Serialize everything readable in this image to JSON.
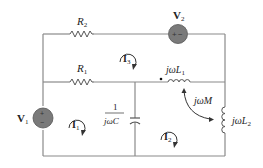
{
  "diagram": {
    "type": "circuit",
    "components": {
      "R2": {
        "label": "R",
        "sub": "2"
      },
      "R1": {
        "label": "R",
        "sub": "1"
      },
      "V2": {
        "label": "V",
        "sub": "2"
      },
      "V1": {
        "label": "V",
        "sub": "1",
        "plus": "+",
        "minus": "−"
      },
      "L1": {
        "label": "jωL",
        "sub": "1"
      },
      "L2": {
        "label": "jωL",
        "sub": "2"
      },
      "M": {
        "label": "jωM"
      },
      "C": {
        "num": "1",
        "den": "jωC"
      }
    },
    "mesh_currents": {
      "I1": {
        "label": "I",
        "sub": "1"
      },
      "I2": {
        "label": "I",
        "sub": "2"
      },
      "I3": {
        "label": "I",
        "sub": "3"
      }
    },
    "colors": {
      "wire": "#8a8a8a",
      "source_fill": "#7a7a7a",
      "text": "#222222"
    }
  }
}
